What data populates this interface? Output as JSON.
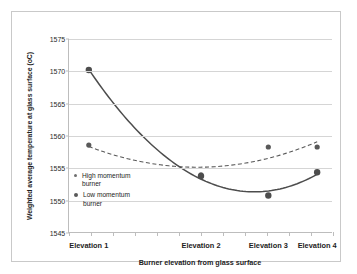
{
  "chart_data": {
    "type": "scatter",
    "title": "",
    "xlabel": "Burner elevation from glass surface",
    "ylabel": "Weighted average temperature at glass surface (oC)",
    "categories": [
      "Elevation 1",
      "Elevation 2",
      "Elevation 3",
      "Elevation 4"
    ],
    "ylim": [
      1545,
      1575
    ],
    "yticks": [
      1545,
      1550,
      1555,
      1560,
      1565,
      1570,
      1575
    ],
    "ytick_labels": [
      "1545",
      "1550",
      "1555",
      "1560",
      "1565",
      "1570",
      "1575"
    ],
    "grid": true,
    "legend_position": "inside-left",
    "series": [
      {
        "name": "High momentum burner",
        "style": "dashed",
        "color": "#595959",
        "values": [
          1558.6,
          1554.0,
          1558.3,
          1558.3
        ]
      },
      {
        "name": "Low momentum burner",
        "style": "solid",
        "color": "#4d4d4d",
        "values": [
          1570.2,
          1553.8,
          1550.8,
          1554.4
        ]
      }
    ]
  },
  "axis": {
    "y_title": "Weighted average temperature at glass surface (oC)",
    "x_title": "Burner elevation from glass surface",
    "y_labels": [
      "1575",
      "1570",
      "1565",
      "1560",
      "1555",
      "1550",
      "1545"
    ],
    "x_labels": [
      "Elevation 1",
      "Elevation 2",
      "Elevation 3",
      "Elevation 4"
    ]
  },
  "legend": {
    "items": [
      {
        "label_line1": "High momentum",
        "label_line2": "burner"
      },
      {
        "label_line1": "Low momentum",
        "label_line2": "burner"
      }
    ]
  },
  "colors": {
    "frame": "#c9c9c9",
    "grid": "#d5d5d5",
    "axis": "#bdbdbd",
    "series_high": "#595959",
    "series_low": "#4d4d4d",
    "text": "#1d1d1d"
  }
}
